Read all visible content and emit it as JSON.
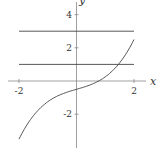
{
  "chart_data": {
    "type": "line",
    "title": "",
    "xlabel": "x",
    "ylabel": "y",
    "xlim": [
      -2.2,
      2.2
    ],
    "ylim": [
      -3.9,
      4.5
    ],
    "xticks": [
      -2,
      2
    ],
    "yticks": [
      -2,
      2,
      4
    ],
    "grid": false,
    "series": [
      {
        "name": "curve",
        "expr": "x^3/4 + x/2 - 0.5",
        "x": [
          -2,
          -1.5,
          -1,
          -0.5,
          0,
          0.5,
          1,
          1.5,
          2
        ],
        "values": [
          -3.5,
          -2.09,
          -1.25,
          -0.78,
          -0.5,
          -0.22,
          0.25,
          1.09,
          2.5
        ]
      },
      {
        "name": "y=3",
        "x": [
          -2,
          2
        ],
        "values": [
          3,
          3
        ]
      },
      {
        "name": "y=1",
        "x": [
          -2,
          2
        ],
        "values": [
          1,
          1
        ]
      }
    ]
  },
  "labels": {
    "x": "x",
    "y": "y",
    "xt": [
      "-2",
      "2"
    ],
    "yt": [
      "4",
      "2",
      "-2"
    ]
  }
}
